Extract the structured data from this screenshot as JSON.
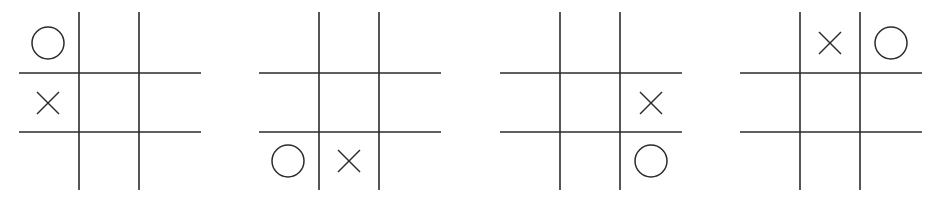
{
  "figure": {
    "colors": {
      "background": "#ffffff",
      "ink": "#2b2b2b"
    },
    "boards": [
      {
        "index": 1,
        "offset_x": 0,
        "cells": [
          [
            "O",
            "",
            ""
          ],
          [
            "X",
            "",
            ""
          ],
          [
            "",
            "",
            ""
          ]
        ]
      },
      {
        "index": 2,
        "offset_x": 240,
        "cells": [
          [
            "",
            "",
            ""
          ],
          [
            "",
            "",
            ""
          ],
          [
            "O",
            "X",
            ""
          ]
        ]
      },
      {
        "index": 3,
        "offset_x": 481,
        "cells": [
          [
            "",
            "",
            ""
          ],
          [
            "",
            "",
            "X"
          ],
          [
            "",
            "",
            "O"
          ]
        ]
      },
      {
        "index": 4,
        "offset_x": 721,
        "cells": [
          [
            "",
            "X",
            "O"
          ],
          [
            "",
            "",
            ""
          ],
          [
            "",
            "",
            ""
          ]
        ]
      }
    ]
  }
}
